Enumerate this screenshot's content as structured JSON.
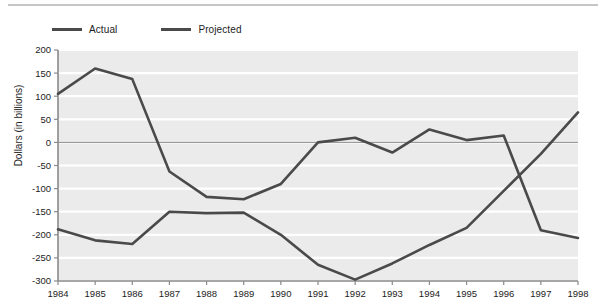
{
  "chart_data": {
    "type": "line",
    "title": "",
    "xlabel": "",
    "ylabel": "Dollars (in billions)",
    "categories": [
      "1984",
      "1985",
      "1986",
      "1987",
      "1988",
      "1989",
      "1990",
      "1991",
      "1992",
      "1993",
      "1994",
      "1995",
      "1996",
      "1997",
      "1998"
    ],
    "ylim": [
      -300,
      200
    ],
    "ytick_values": [
      200,
      150,
      100,
      50,
      0,
      -50,
      -100,
      -150,
      -200,
      -250,
      -300
    ],
    "ytick_labels": [
      "200",
      "150",
      "100",
      "50",
      "0",
      "-50",
      "-100",
      "-150",
      "-200",
      "-250",
      "-300"
    ],
    "grid": true,
    "legend_position": "top-left",
    "series": [
      {
        "name": "Actual",
        "color": "#4a4a4a",
        "values": [
          105,
          160,
          137,
          -63,
          -118,
          -123,
          -90,
          0,
          10,
          -22,
          28,
          5,
          15,
          -190,
          -207
        ]
      },
      {
        "name": "Projected",
        "color": "#4a4a4a",
        "values": [
          -188,
          -212,
          -220,
          -150,
          -153,
          -152,
          -200,
          -265,
          -297,
          -262,
          -222,
          -185,
          -105,
          -25,
          65
        ]
      }
    ]
  },
  "legend": {
    "items": [
      {
        "label": "Actual"
      },
      {
        "label": "Projected"
      }
    ]
  },
  "axis": {
    "y_title": "Dollars (in billions)"
  },
  "colors": {
    "line": "#4a4a4a",
    "plot_background": "#ebebeb",
    "gridline": "#ffffff",
    "zero_line": "#9a9a9a",
    "axis": "#8a8a8a",
    "text": "#1c1c1c"
  }
}
